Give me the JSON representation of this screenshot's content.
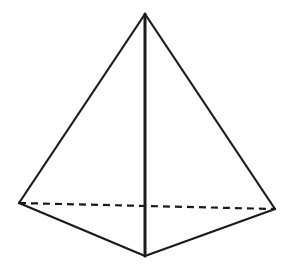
{
  "diagram": {
    "type": "triangular-pyramid",
    "stroke_color": "#1a1a1a",
    "background": "#ffffff",
    "vertices": {
      "apex": [
        145,
        14
      ],
      "left": [
        19,
        203
      ],
      "front": [
        145,
        256
      ],
      "right": [
        275,
        209
      ]
    },
    "edges": [
      {
        "from": "apex",
        "to": "left",
        "style": "solid"
      },
      {
        "from": "apex",
        "to": "right",
        "style": "solid"
      },
      {
        "from": "apex",
        "to": "front",
        "style": "solid"
      },
      {
        "from": "left",
        "to": "front",
        "style": "solid"
      },
      {
        "from": "front",
        "to": "right",
        "style": "solid"
      },
      {
        "from": "left",
        "to": "right",
        "style": "dashed"
      }
    ]
  }
}
